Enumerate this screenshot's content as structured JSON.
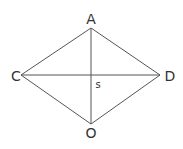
{
  "diagram": {
    "type": "rhombus-with-diagonals",
    "stroke_color": "#555555",
    "label_color": "#333333",
    "vertices": {
      "A": {
        "label": "A",
        "x": 91,
        "y": 28
      },
      "C": {
        "label": "C",
        "x": 21,
        "y": 75
      },
      "D": {
        "label": "D",
        "x": 160,
        "y": 75
      },
      "O": {
        "label": "O",
        "x": 91,
        "y": 124
      }
    },
    "intersection": {
      "label": "s",
      "x": 91,
      "y": 75
    },
    "edges": [
      [
        "A",
        "C"
      ],
      [
        "A",
        "D"
      ],
      [
        "C",
        "O"
      ],
      [
        "D",
        "O"
      ]
    ],
    "diagonals": [
      [
        "A",
        "O"
      ],
      [
        "C",
        "D"
      ]
    ]
  }
}
